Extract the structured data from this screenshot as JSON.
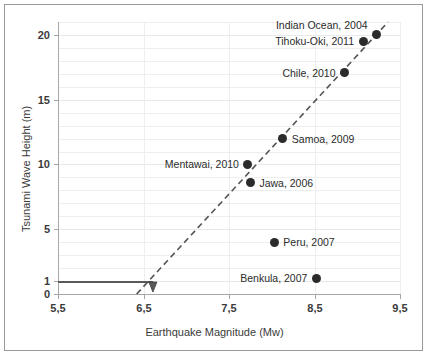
{
  "chart_data": {
    "type": "scatter",
    "title": "",
    "xlabel": "Earthquake Magnitude (Mw)",
    "ylabel": "Tsunami Wave Height (m)",
    "xlim": [
      5.5,
      9.5
    ],
    "ylim": [
      0,
      21
    ],
    "xticks": [
      "5,5",
      "6,5",
      "7,5",
      "8,5",
      "9,5"
    ],
    "xtick_values": [
      5.5,
      6.5,
      7.5,
      8.5,
      9.5
    ],
    "yticks": [
      "0",
      "1",
      "5",
      "10",
      "15",
      "20"
    ],
    "ytick_values": [
      0,
      1,
      5,
      10,
      15,
      20
    ],
    "grid": true,
    "legend": "none",
    "points": [
      {
        "label": "Indian Ocean, 2004",
        "x": 9.23,
        "y": 20.0,
        "label_pos": "upper-left"
      },
      {
        "label": "Tihoku-Oki, 2011",
        "x": 9.07,
        "y": 19.5,
        "label_pos": "left"
      },
      {
        "label": "Chile, 2010",
        "x": 8.85,
        "y": 17.1,
        "label_pos": "left"
      },
      {
        "label": "Samoa, 2009",
        "x": 8.13,
        "y": 12.0,
        "label_pos": "right"
      },
      {
        "label": "Mentawai, 2010",
        "x": 7.72,
        "y": 10.0,
        "label_pos": "left"
      },
      {
        "label": "Jawa, 2006",
        "x": 7.75,
        "y": 8.6,
        "label_pos": "right"
      },
      {
        "label": "Peru, 2007",
        "x": 8.03,
        "y": 4.0,
        "label_pos": "right"
      },
      {
        "label": "Benkula, 2007",
        "x": 8.52,
        "y": 1.2,
        "label_pos": "left"
      }
    ],
    "trendline": {
      "style": "dashed",
      "color": "#555555",
      "x_start": 6.42,
      "y_start": 0.0,
      "x_end": 9.36,
      "y_end": 21.0
    },
    "threshold_marker": {
      "description": "horizontal line at wave height 1 m extending from axis to magnitude 6.6 with downward arrow",
      "y": 1,
      "x_from": 5.5,
      "x_to": 6.61,
      "color": "#595959"
    },
    "colors": {
      "marker": "#2b2b2b",
      "axis": "#a6a6a6",
      "grid": "#eceef0",
      "text": "#3b3b3b",
      "frame": "#9a9a9a"
    }
  }
}
